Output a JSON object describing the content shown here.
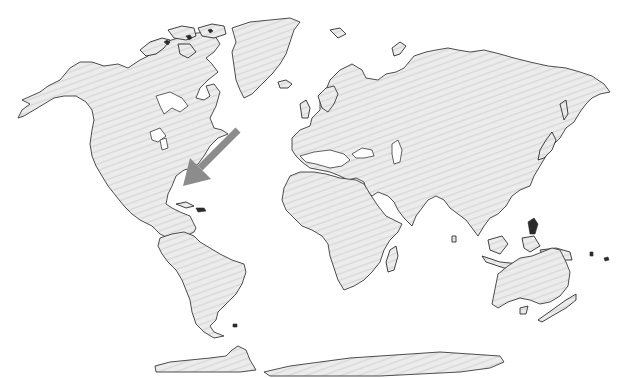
{
  "map": {
    "type": "world-outline-map",
    "projection": "equirectangular-like",
    "colors": {
      "background": "#ffffff",
      "land_fill": "#ebebeb",
      "land_hatch": "#dcdcdc",
      "coastline": "#3a3a3a",
      "arrow": "#8c8c8c"
    },
    "regions": [
      {
        "name": "North America"
      },
      {
        "name": "Greenland"
      },
      {
        "name": "South America"
      },
      {
        "name": "Europe"
      },
      {
        "name": "Asia"
      },
      {
        "name": "Africa"
      },
      {
        "name": "Australia"
      },
      {
        "name": "New Zealand"
      },
      {
        "name": "Madagascar"
      },
      {
        "name": "Antarctica"
      }
    ],
    "annotation": {
      "type": "arrow",
      "color": "#8c8c8c",
      "tail": [
        238,
        130
      ],
      "head": [
        183,
        186
      ],
      "points_to": "Caribbean"
    }
  }
}
